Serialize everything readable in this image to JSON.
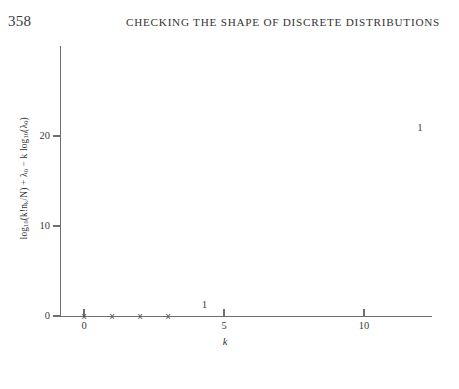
{
  "page": {
    "folio": "358",
    "running_head": "CHECKING THE SHAPE OF DISCRETE DISTRIBUTIONS"
  },
  "chart_data": {
    "type": "scatter",
    "title": "",
    "xlabel": "k",
    "ylabel": "log10(k!nk/N) + λ0 − k log10(λ0)",
    "ylabel_parts": {
      "lead": "log",
      "lead_sub": "10",
      "mid": "(k!n",
      "mid_sub": "k",
      "mid2": "/N) + λ",
      "mid2_sub": "0",
      "tail": " − k log",
      "tail_sub": "10",
      "tail2": "(λ",
      "tail2_sub": "0",
      "tail3": ")"
    },
    "xlim": [
      -0.85,
      13.3
    ],
    "ylim": [
      -1.2,
      29.1
    ],
    "xticks": [
      0,
      5,
      10
    ],
    "xtick_labels": [
      "0",
      "5",
      "10"
    ],
    "yticks": [
      0,
      10,
      20
    ],
    "ytick_labels": [
      "0",
      "10",
      "20"
    ],
    "grid": false,
    "legend": "none",
    "points": [
      {
        "x": 0,
        "y": 0,
        "marker": "x",
        "label": "x"
      },
      {
        "x": 1,
        "y": 0,
        "marker": "x",
        "label": "x"
      },
      {
        "x": 2,
        "y": 0,
        "marker": "x",
        "label": "x"
      },
      {
        "x": 3,
        "y": 0,
        "marker": "x",
        "label": "x"
      },
      {
        "x": 4.3,
        "y": 1.3,
        "marker": "text",
        "label": "1"
      },
      {
        "x": 12.0,
        "y": 21.0,
        "marker": "text",
        "label": "1"
      }
    ]
  }
}
